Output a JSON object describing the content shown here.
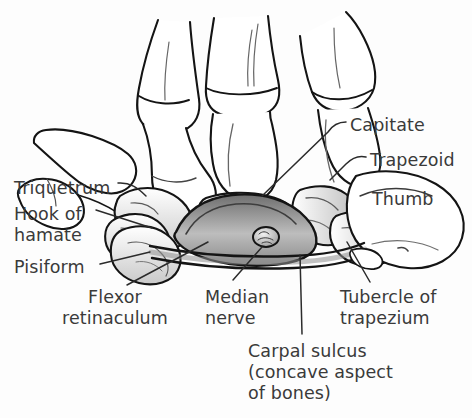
{
  "figure": {
    "background_color": "#fdfdfd",
    "line_color": "#1a1a1a",
    "label_color": "#3a3a3a",
    "bone_fill": "#ffffff",
    "shade_fill": "#d9d9d9",
    "dark_shade_fill": "#8c8c8c"
  },
  "labels": {
    "triquetrum": {
      "text": "Triquetrum",
      "x": 14,
      "y": 178
    },
    "hook_of_hamate": {
      "line1": "Hook of",
      "line2": "hamate",
      "x": 14,
      "y": 204
    },
    "pisiform": {
      "text": "Pisiform",
      "x": 14,
      "y": 257
    },
    "flexor_retinaculum": {
      "line1": "Flexor",
      "line2": "retinaculum",
      "x": 62,
      "y": 287
    },
    "median_nerve": {
      "line1": "Median",
      "line2": "nerve",
      "x": 205,
      "y": 287
    },
    "tubercle_of_trapezium": {
      "line1": "Tubercle of",
      "line2": "trapezium",
      "x": 340,
      "y": 287
    },
    "carpal_sulcus": {
      "line1": "Carpal sulcus",
      "line2": "(concave aspect",
      "line3": "of bones)",
      "x": 248,
      "y": 341
    },
    "capitate": {
      "text": "Capitate",
      "x": 350,
      "y": 115
    },
    "trapezoid": {
      "text": "Trapezoid",
      "x": 370,
      "y": 150
    },
    "thumb": {
      "text": "Thumb",
      "x": 372,
      "y": 189
    }
  },
  "structures": [
    {
      "name": "metacarpal-1",
      "kind": "bone",
      "label": "First metacarpal"
    },
    {
      "name": "metacarpal-2",
      "kind": "bone",
      "label": "Second metacarpal"
    },
    {
      "name": "metacarpal-3",
      "kind": "bone",
      "label": "Third metacarpal"
    },
    {
      "name": "metacarpal-4",
      "kind": "bone",
      "label": "Fourth metacarpal"
    },
    {
      "name": "triquetrum-bone",
      "kind": "carpal-bone",
      "label": "Triquetrum"
    },
    {
      "name": "hamate-hook-bone",
      "kind": "carpal-bone",
      "label": "Hook of hamate"
    },
    {
      "name": "pisiform-bone",
      "kind": "carpal-bone",
      "label": "Pisiform"
    },
    {
      "name": "capitate-bone",
      "kind": "carpal-bone",
      "label": "Capitate"
    },
    {
      "name": "trapezoid-bone",
      "kind": "carpal-bone",
      "label": "Trapezoid"
    },
    {
      "name": "trapezium-tubercle-bone",
      "kind": "carpal-bone",
      "label": "Tubercle of trapezium"
    },
    {
      "name": "thumb-bone",
      "kind": "bone",
      "label": "Thumb"
    },
    {
      "name": "flexor-retinaculum-band",
      "kind": "ligament",
      "label": "Flexor retinaculum"
    },
    {
      "name": "median-nerve-section",
      "kind": "nerve",
      "label": "Median nerve"
    },
    {
      "name": "carpal-sulcus-arch",
      "kind": "sulcus",
      "label": "Carpal sulcus"
    }
  ]
}
